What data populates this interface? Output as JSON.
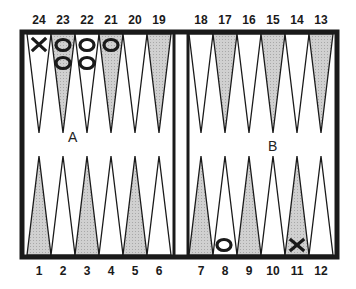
{
  "board": {
    "top_labels": [
      "24",
      "23",
      "22",
      "21",
      "20",
      "19",
      "18",
      "17",
      "16",
      "15",
      "14",
      "13"
    ],
    "bottom_labels": [
      "1",
      "2",
      "3",
      "4",
      "5",
      "6",
      "7",
      "8",
      "9",
      "10",
      "11",
      "12"
    ],
    "annotations": [
      {
        "text": "A",
        "near": "point 23 tip"
      },
      {
        "text": "B",
        "near": "point 15 tip"
      }
    ],
    "colors": {
      "frame": "#1a1a1a",
      "shaded_point": "#c8c8c8",
      "light_point": "#ffffff",
      "background": "#ffffff"
    },
    "checkers": [
      {
        "point": 24,
        "player": "X",
        "count": 1
      },
      {
        "point": 23,
        "player": "O",
        "count": 2
      },
      {
        "point": 22,
        "player": "O",
        "count": 2
      },
      {
        "point": 21,
        "player": "O",
        "count": 1
      },
      {
        "point": 8,
        "player": "O",
        "count": 1
      },
      {
        "point": 11,
        "player": "X",
        "count": 1
      }
    ]
  },
  "labels": {
    "a": "A",
    "b": "B"
  }
}
